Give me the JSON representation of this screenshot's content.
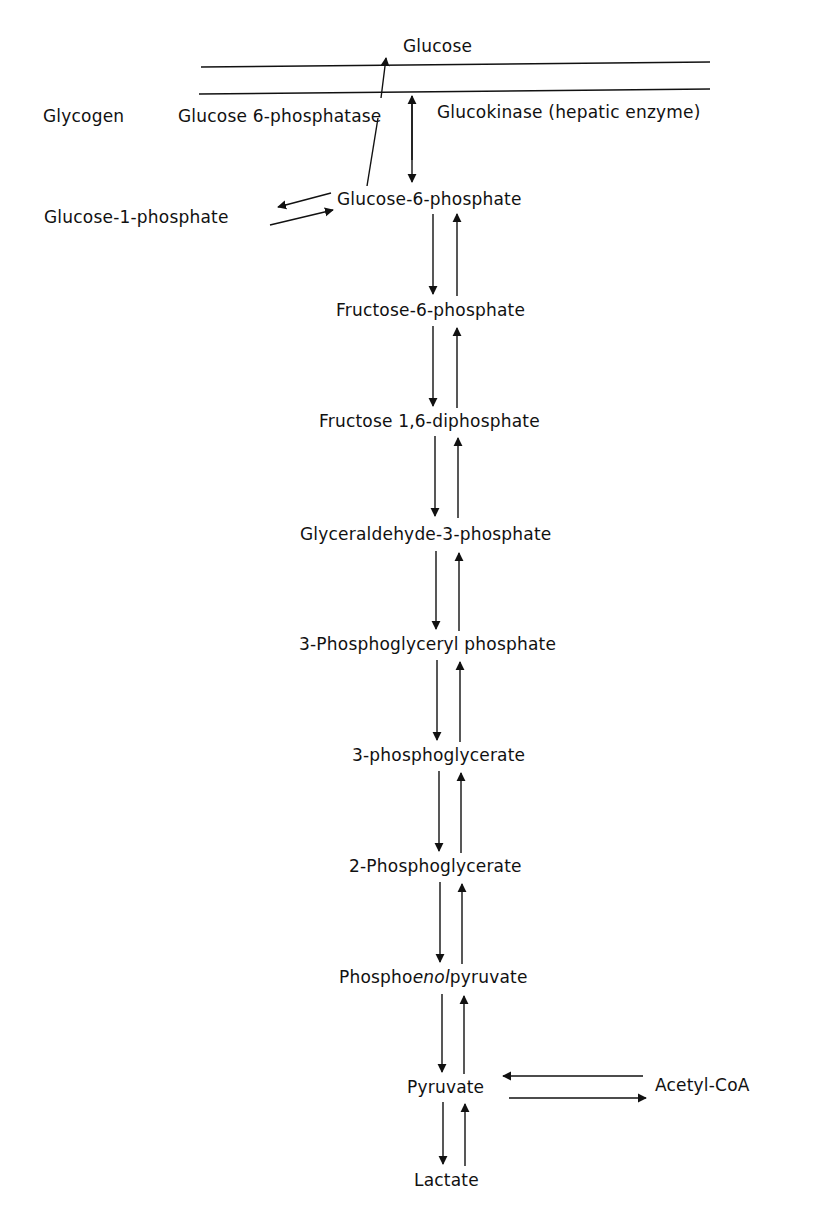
{
  "diagram": {
    "type": "metabolic-pathway",
    "colors": {
      "line": "#111111",
      "background": "#ffffff"
    },
    "membrane": {
      "top_label": "Glucose"
    },
    "side_labels": {
      "glycogen": "Glycogen",
      "phosphatase": "Glucose 6-phosphatase",
      "glucokinase": "Glucokinase (hepatic enzyme)",
      "g1p": "Glucose-1-phosphate",
      "acetyl_coa": "Acetyl-CoA"
    },
    "pathway": [
      {
        "label": "Glucose-6-phosphate"
      },
      {
        "label": "Fructose-6-phosphate"
      },
      {
        "label": "Fructose 1,6-diphosphate"
      },
      {
        "label": "Glyceraldehyde-3-phosphate"
      },
      {
        "label": "3-Phosphoglyceryl phosphate"
      },
      {
        "label": "3-phosphoglycerate"
      },
      {
        "label": "2-Phosphoglycerate"
      },
      {
        "label_pre": "Phospho",
        "label_italic": "enol",
        "label_post": "pyruvate"
      },
      {
        "label": "Pyruvate"
      },
      {
        "label": "Lactate"
      }
    ]
  }
}
